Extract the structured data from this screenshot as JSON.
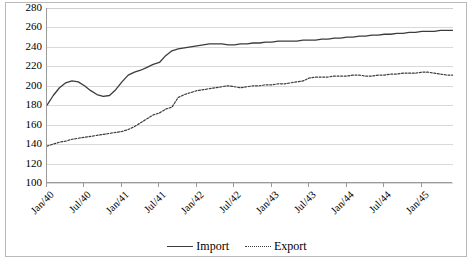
{
  "chart_data": {
    "type": "line",
    "title": "",
    "xlabel": "",
    "ylabel": "",
    "ylim": [
      100,
      280
    ],
    "ytick_values": [
      100,
      120,
      140,
      160,
      180,
      200,
      220,
      240,
      260,
      280
    ],
    "ytick_labels": [
      "100",
      "120",
      "140",
      "160",
      "180",
      "200",
      "220",
      "240",
      "260",
      "280"
    ],
    "grid": true,
    "legend_position": "bottom",
    "categories": [
      "Jan/40",
      "Feb/40",
      "Mar/40",
      "Apr/40",
      "May/40",
      "Jun/40",
      "Jul/40",
      "Aug/40",
      "Sep/40",
      "Oct/40",
      "Nov/40",
      "Dec/40",
      "Jan/41",
      "Feb/41",
      "Mar/41",
      "Apr/41",
      "May/41",
      "Jun/41",
      "Jul/41",
      "Aug/41",
      "Sep/41",
      "Oct/41",
      "Nov/41",
      "Dec/41",
      "Jan/42",
      "Feb/42",
      "Mar/42",
      "Apr/42",
      "May/42",
      "Jun/42",
      "Jul/42",
      "Aug/42",
      "Sep/42",
      "Oct/42",
      "Nov/42",
      "Dec/42",
      "Jan/43",
      "Feb/43",
      "Mar/43",
      "Apr/43",
      "May/43",
      "Jun/43",
      "Jul/43",
      "Aug/43",
      "Sep/43",
      "Oct/43",
      "Nov/43",
      "Dec/43",
      "Jan/44",
      "Feb/44",
      "Mar/44",
      "Apr/44",
      "May/44",
      "Jun/44",
      "Jul/44",
      "Aug/44",
      "Sep/44",
      "Oct/44",
      "Nov/44",
      "Dec/44",
      "Jan/45",
      "Feb/45",
      "Mar/45",
      "Apr/45",
      "May/45",
      "Jun/45"
    ],
    "xtick_labels": [
      "Jan/40",
      "Jul/40",
      "Jan/41",
      "Jul/41",
      "Jan/42",
      "Jul/42",
      "Jan/43",
      "Jul/43",
      "Jan/44",
      "Jul/44",
      "Jan/45"
    ],
    "xtick_indices": [
      0,
      6,
      12,
      18,
      24,
      30,
      36,
      42,
      48,
      54,
      60
    ],
    "series": [
      {
        "name": "Import",
        "style": "solid",
        "color": "#3c3c3c",
        "values": [
          180,
          190,
          198,
          203,
          205,
          204,
          200,
          195,
          191,
          189,
          190,
          196,
          204,
          211,
          214,
          216,
          219,
          222,
          224,
          231,
          236,
          238,
          239,
          240,
          241,
          242,
          243,
          243,
          243,
          242,
          242,
          243,
          243,
          244,
          244,
          245,
          245,
          246,
          246,
          246,
          246,
          247,
          247,
          247,
          248,
          248,
          249,
          249,
          250,
          250,
          251,
          251,
          252,
          252,
          253,
          253,
          254,
          254,
          255,
          255,
          256,
          256,
          256,
          257,
          257,
          257
        ]
      },
      {
        "name": "Export",
        "style": "dotted",
        "color": "#3c3c3c",
        "values": [
          138,
          140,
          142,
          143,
          145,
          146,
          147,
          148,
          149,
          150,
          151,
          152,
          153,
          155,
          158,
          162,
          166,
          170,
          172,
          176,
          178,
          188,
          191,
          193,
          195,
          196,
          197,
          198,
          199,
          200,
          199,
          198,
          199,
          200,
          200,
          201,
          201,
          202,
          202,
          203,
          204,
          205,
          208,
          209,
          209,
          209,
          210,
          210,
          210,
          211,
          211,
          210,
          210,
          211,
          211,
          212,
          212,
          213,
          213,
          213,
          214,
          214,
          213,
          212,
          211,
          211
        ]
      }
    ]
  },
  "legend": {
    "items": [
      {
        "label": "Import",
        "style": "solid"
      },
      {
        "label": "Export",
        "style": "dotted"
      }
    ]
  }
}
